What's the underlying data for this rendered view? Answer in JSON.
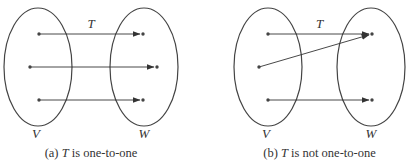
{
  "panels": [
    {
      "id": "a",
      "caption_prefix": "(a) ",
      "caption_var": "T",
      "caption_suffix": " is one-to-one",
      "map_label": "T",
      "domain_label": "V",
      "codomain_label": "W",
      "domain_set": {
        "cx": 38,
        "cy": 67,
        "rx": 34,
        "ry": 59
      },
      "codomain_set": {
        "cx": 144,
        "cy": 67,
        "rx": 34,
        "ry": 59
      },
      "domain_points": [
        [
          39,
          34
        ],
        [
          30,
          67
        ],
        [
          39,
          100
        ]
      ],
      "codomain_points": [
        [
          143,
          34
        ],
        [
          157,
          67
        ],
        [
          143,
          100
        ]
      ],
      "mappings": [
        [
          0,
          0
        ],
        [
          1,
          1
        ],
        [
          2,
          2
        ]
      ]
    },
    {
      "id": "b",
      "caption_prefix": "(b) ",
      "caption_var": "T",
      "caption_suffix": " is not one-to-one",
      "map_label": "T",
      "domain_label": "V",
      "codomain_label": "W",
      "domain_set": {
        "cx": 268,
        "cy": 67,
        "rx": 34,
        "ry": 59
      },
      "codomain_set": {
        "cx": 371,
        "cy": 67,
        "rx": 34,
        "ry": 59
      },
      "domain_points": [
        [
          268,
          34
        ],
        [
          259,
          67
        ],
        [
          268,
          100
        ]
      ],
      "codomain_points": [
        [
          372,
          34
        ],
        [
          372,
          100
        ]
      ],
      "mappings": [
        [
          0,
          0
        ],
        [
          1,
          0
        ],
        [
          2,
          1
        ]
      ]
    }
  ],
  "colors": {
    "stroke": "#444444",
    "point": "#444444",
    "arrow": "#333333"
  }
}
